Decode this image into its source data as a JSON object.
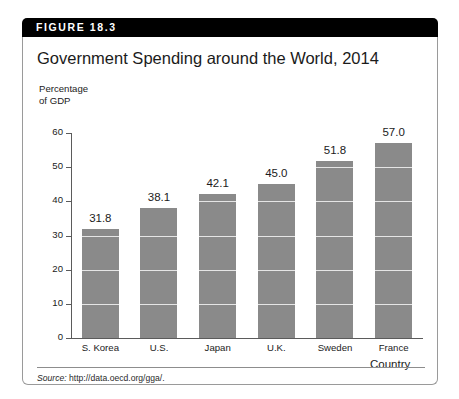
{
  "figure": {
    "banner_label": "FIGURE 18.3",
    "title": "Government Spending around the World, 2014",
    "source_prefix": "Source:",
    "source_text": "http://data.oecd.org/gga/."
  },
  "colors": {
    "banner_background": "#000000",
    "banner_text": "#ffffff",
    "bar_fill": "#8a8a8a",
    "axis_line": "#5b5b5b",
    "gridline": "#ffffff",
    "page_background": "#ffffff",
    "border": "#9a9a9a"
  },
  "chart_data": {
    "type": "bar",
    "title": "Government Spending around the World, 2014",
    "categories": [
      "S. Korea",
      "U.S.",
      "Japan",
      "U.K.",
      "Sweden",
      "France"
    ],
    "values": [
      31.8,
      38.1,
      42.1,
      45.0,
      51.8,
      57.0
    ],
    "value_labels": [
      "31.8",
      "38.1",
      "42.1",
      "45.0",
      "51.8",
      "57.0"
    ],
    "xlabel": "Country",
    "ylabel": "Percentage of GDP",
    "ylabel_line1": "Percentage",
    "ylabel_line2": "of GDP",
    "ylim": [
      0,
      60
    ],
    "ytick_values": [
      0,
      10,
      20,
      30,
      40,
      50,
      60
    ],
    "ytick_labels": [
      "0",
      "10",
      "20",
      "30",
      "40",
      "50",
      "60"
    ],
    "grid": true,
    "grid_axis": "y",
    "legend": false,
    "legend_position": "none",
    "bar_color": "#8a8a8a",
    "source": "Source: http://data.oecd.org/gga/."
  }
}
